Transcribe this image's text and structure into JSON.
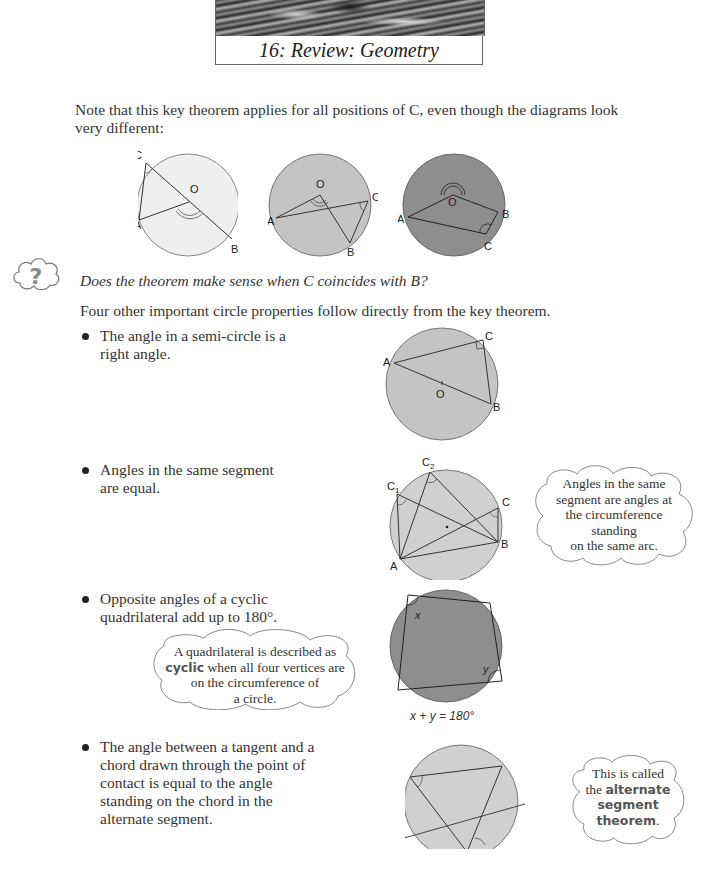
{
  "header": {
    "title": "16: Review: Geometry"
  },
  "intro": {
    "text": "Note that this key theorem applies for all positions of C, even though the diagrams look very different:"
  },
  "key_theorem_diagrams": [
    {
      "name": "light-circle",
      "fill": "#efefef",
      "labels": [
        "C",
        "O",
        "A",
        "B"
      ]
    },
    {
      "name": "mid-circle",
      "fill": "#c4c4c4",
      "labels": [
        "O",
        "C",
        "A",
        "B"
      ]
    },
    {
      "name": "dark-circle",
      "fill": "#8e8e8e",
      "labels": [
        "O",
        "A",
        "B",
        "C"
      ]
    }
  ],
  "question": {
    "icon": "question-cloud-icon",
    "text": "Does the theorem make sense when C coincides with B?"
  },
  "lead_in": {
    "text": "Four other important circle properties follow directly from the key theorem."
  },
  "properties": [
    {
      "text_lines": [
        "The angle in a semi-circle is a",
        "right angle."
      ],
      "diagram": {
        "labels": {
          "a": "A",
          "b": "B",
          "c": "C",
          "o": "O"
        },
        "fill": "#c4c4c4"
      }
    },
    {
      "text_lines": [
        "Angles in the same segment",
        "are equal."
      ],
      "diagram": {
        "labels": {
          "c1": "C",
          "c1_sub": "1",
          "c2": "C",
          "c2_sub": "2",
          "c3": "C",
          "c3_sub": "3",
          "a": "A",
          "b": "B"
        },
        "fill": "#d0d0d0"
      },
      "note": [
        "Angles in the same",
        "segment are angles at",
        "the circumference",
        "standing",
        "on the same arc."
      ]
    },
    {
      "text_lines": [
        "Opposite angles of a cyclic",
        "quadrilateral add up to 180°."
      ],
      "diagram": {
        "labels": {
          "x": "x",
          "y": "y"
        },
        "fill": "#8e8e8e",
        "caption": "x + y = 180°"
      },
      "note": {
        "line1": "A quadrilateral is described as",
        "keyword": "cyclic",
        "line2_rest": " when all four vertices are",
        "line3": "on the circumference of",
        "line4": "a circle."
      }
    },
    {
      "text_lines": [
        "The angle between a tangent and a",
        "chord drawn through the point of",
        "contact is equal to the angle",
        "standing on the chord in the",
        "alternate segment."
      ],
      "diagram": {
        "fill": "#d0d0d0"
      },
      "note": {
        "line1": "This is called",
        "line2_pre": "the ",
        "keyword1": "alternate",
        "keyword2": "segment",
        "keyword3": "theorem",
        "end": "."
      }
    }
  ]
}
